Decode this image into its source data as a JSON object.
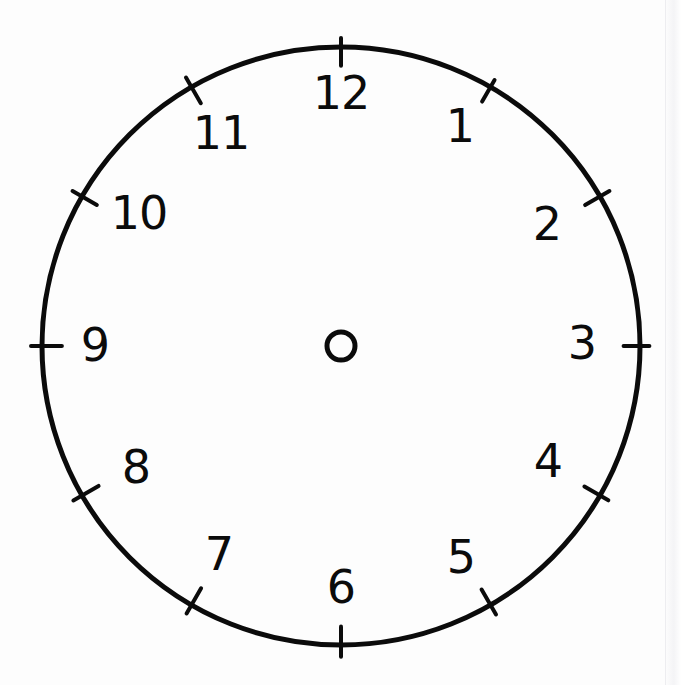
{
  "document": {
    "kind": "clock-face-worksheet",
    "title": "Blank Analog Clock Face",
    "background_color": "#fdfdfd",
    "ink_color": "#0b0b0b"
  },
  "clock": {
    "center_x": 341,
    "center_y": 346,
    "radius": 299,
    "rim_stroke_width": 5,
    "hub": {
      "label": "center-pivot",
      "radius": 14,
      "stroke_width": 5
    },
    "numeral_radius": 238,
    "tick": {
      "inner_offset": 18,
      "outer_offset": 10,
      "stroke_width": 4
    },
    "hands": [],
    "numerals": [
      {
        "label": "12",
        "hour": 12,
        "angle_deg": 0,
        "x": 341,
        "y": 96,
        "tick_angle_deg": 0
      },
      {
        "label": "1",
        "hour": 1,
        "angle_deg": 30,
        "x": 460,
        "y": 129,
        "tick_angle_deg": 30
      },
      {
        "label": "2",
        "hour": 2,
        "angle_deg": 60,
        "x": 547,
        "y": 227,
        "tick_angle_deg": 60
      },
      {
        "label": "3",
        "hour": 3,
        "angle_deg": 90,
        "x": 582,
        "y": 346,
        "tick_angle_deg": 90
      },
      {
        "label": "4",
        "hour": 4,
        "angle_deg": 120,
        "x": 548,
        "y": 464,
        "tick_angle_deg": 120
      },
      {
        "label": "5",
        "hour": 5,
        "angle_deg": 150,
        "x": 461,
        "y": 560,
        "tick_angle_deg": 150
      },
      {
        "label": "6",
        "hour": 6,
        "angle_deg": 180,
        "x": 341,
        "y": 590,
        "tick_angle_deg": 180
      },
      {
        "label": "7",
        "hour": 7,
        "angle_deg": 210,
        "x": 219,
        "y": 557,
        "tick_angle_deg": 210
      },
      {
        "label": "8",
        "hour": 8,
        "angle_deg": 240,
        "x": 136,
        "y": 470,
        "tick_angle_deg": 240
      },
      {
        "label": "9",
        "hour": 9,
        "angle_deg": 270,
        "x": 95,
        "y": 348,
        "tick_angle_deg": 270
      },
      {
        "label": "10",
        "hour": 10,
        "angle_deg": 300,
        "x": 139,
        "y": 216,
        "tick_angle_deg": 300
      },
      {
        "label": "11",
        "hour": 11,
        "angle_deg": 330,
        "x": 221,
        "y": 136,
        "tick_angle_deg": 330
      }
    ]
  }
}
